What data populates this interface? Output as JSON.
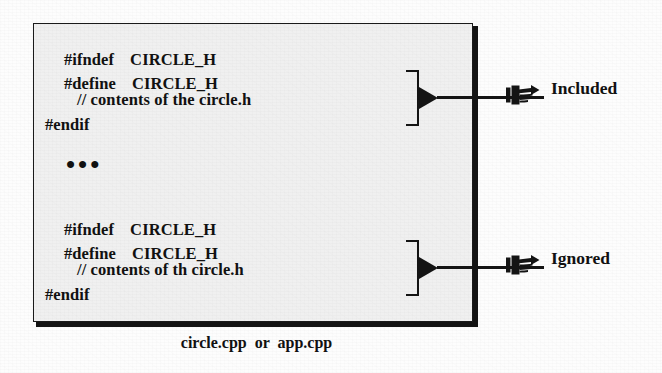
{
  "figure": {
    "kind": "include-guard-diagram",
    "caption": "circle.cpp  or  app.cpp",
    "box_fill": "#f0f0f0",
    "ink_color": "#141414",
    "page_background": "#fdfdfd"
  },
  "code_blocks": [
    {
      "id": "first-include",
      "lines": [
        {
          "keyword": "#ifndef",
          "macro": "CIRCLE_H"
        },
        {
          "keyword": "#define",
          "macro": "CIRCLE_H"
        }
      ],
      "comment": "// contents of the circle.h",
      "end": "#endif"
    },
    {
      "id": "second-include",
      "lines": [
        {
          "keyword": "#ifndef",
          "macro": "CIRCLE_H"
        },
        {
          "keyword": "#define",
          "macro": "CIRCLE_H"
        }
      ],
      "comment": "// contents of th circle.h",
      "end": "#endif"
    }
  ],
  "separator": {
    "ellipsis": "•••"
  },
  "annotations": [
    {
      "id": "included",
      "label": "Included",
      "icon": "pointing-hand-icon",
      "brace": "]",
      "arrow": "right-triangle"
    },
    {
      "id": "ignored",
      "label": "Ignored",
      "icon": "pointing-hand-icon",
      "brace": "]",
      "arrow": "right-triangle"
    }
  ]
}
